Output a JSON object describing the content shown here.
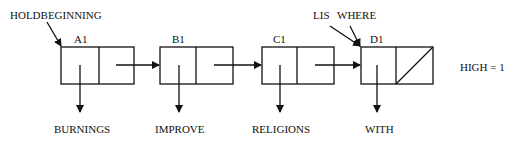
{
  "diagram": {
    "pointers": {
      "holdbeginning": "HOLDBEGINNING",
      "lis": "LIS",
      "where": "WHERE"
    },
    "nodes": [
      {
        "name": "A1",
        "value": "BURNINGS"
      },
      {
        "name": "B1",
        "value": "IMPROVE"
      },
      {
        "name": "C1",
        "value": "RELIGIONS"
      },
      {
        "name": "D1",
        "value": "WITH"
      }
    ],
    "annotation": "HIGH = 1",
    "colors": {
      "line": "#111111",
      "background": "#ffffff"
    }
  }
}
